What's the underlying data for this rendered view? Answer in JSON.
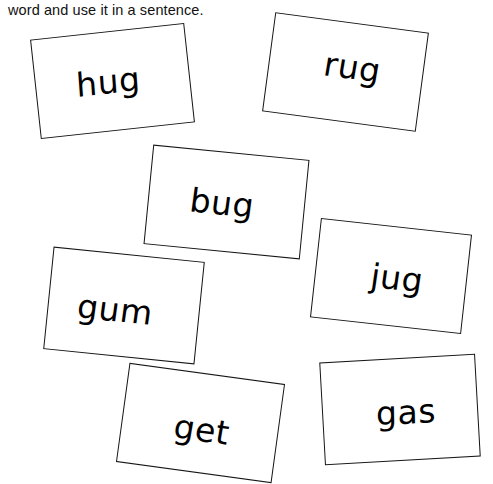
{
  "page": {
    "title": "word and use it in a sentence.",
    "background_color": "#ffffff",
    "ink_color": "#000000"
  },
  "instruction": {
    "text": "word and use it in a sentence."
  },
  "cards": [
    {
      "word": "hug",
      "name": "word-card-hug"
    },
    {
      "word": "rug",
      "name": "word-card-rug"
    },
    {
      "word": "bug",
      "name": "word-card-bug"
    },
    {
      "word": "jug",
      "name": "word-card-jug"
    },
    {
      "word": "gum",
      "name": "word-card-gum"
    },
    {
      "word": "get",
      "name": "word-card-get"
    },
    {
      "word": "gas",
      "name": "word-card-gas"
    }
  ]
}
